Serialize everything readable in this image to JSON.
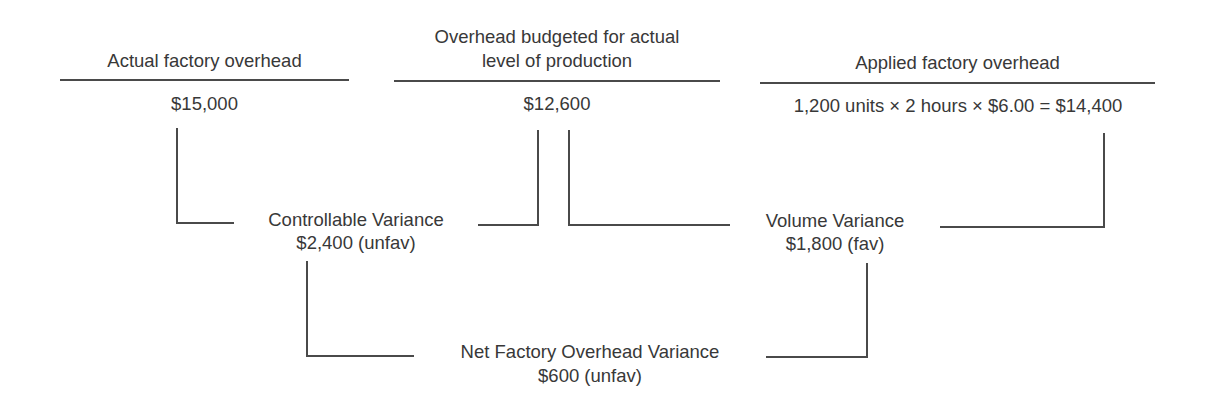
{
  "columns": [
    {
      "header": "Actual factory overhead",
      "value": "$15,000"
    },
    {
      "header_line1": "Overhead budgeted for actual",
      "header_line2": "level of production",
      "value": "$12,600"
    },
    {
      "header": "Applied factory overhead",
      "value": "1,200 units × 2 hours × $6.00 = $14,400"
    }
  ],
  "variances": {
    "controllable": {
      "label": "Controllable Variance",
      "value": "$2,400 (unfav)"
    },
    "volume": {
      "label": "Volume Variance",
      "value": "$1,800 (fav)"
    },
    "net": {
      "label": "Net Factory Overhead Variance",
      "value": "$600 (unfav)"
    }
  },
  "colors": {
    "text": "#383838",
    "lines": "#4a4a4a",
    "background": "#ffffff"
  }
}
